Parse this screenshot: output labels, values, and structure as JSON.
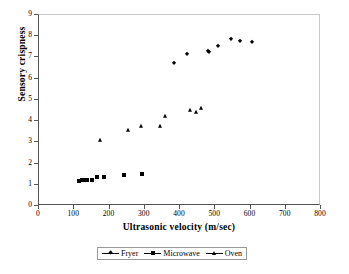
{
  "chart_data": {
    "type": "scatter",
    "title": "",
    "xlabel": "Ultrasonic  velocity (m/sec)",
    "ylabel": "Sensory crispness",
    "xlim": [
      0,
      800
    ],
    "ylim": [
      0,
      9
    ],
    "xticks": [
      0,
      100,
      200,
      300,
      400,
      500,
      600,
      700,
      800
    ],
    "yticks": [
      0,
      1,
      2,
      3,
      4,
      5,
      6,
      7,
      8,
      9
    ],
    "grid": false,
    "legend_position": "bottom-center",
    "marker_color": "#000000",
    "series": [
      {
        "name": "Fryer",
        "marker": "diamond",
        "points": [
          [
            385,
            6.7
          ],
          [
            423,
            7.1
          ],
          [
            481,
            7.26
          ],
          [
            486,
            7.21
          ],
          [
            512,
            7.48
          ],
          [
            548,
            7.8
          ],
          [
            572,
            7.75
          ],
          [
            607,
            7.68
          ]
        ]
      },
      {
        "name": "Microwave",
        "marker": "square",
        "points": [
          [
            116,
            1.12
          ],
          [
            124,
            1.17
          ],
          [
            129,
            1.2
          ],
          [
            139,
            1.18
          ],
          [
            152,
            1.18
          ],
          [
            167,
            1.32
          ],
          [
            186,
            1.31
          ],
          [
            244,
            1.42
          ],
          [
            296,
            1.45
          ]
        ]
      },
      {
        "name": "Oven",
        "marker": "triangle",
        "points": [
          [
            176,
            3.05
          ],
          [
            255,
            3.52
          ],
          [
            293,
            3.72
          ],
          [
            347,
            3.72
          ],
          [
            360,
            4.21
          ],
          [
            430,
            4.46
          ],
          [
            448,
            4.38
          ],
          [
            462,
            4.56
          ]
        ]
      }
    ]
  },
  "legend": {
    "entries": [
      {
        "label": "Fryer",
        "marker": "diamond"
      },
      {
        "label": "Microwave",
        "marker": "square"
      },
      {
        "label": "Oven",
        "marker": "triangle"
      }
    ]
  }
}
